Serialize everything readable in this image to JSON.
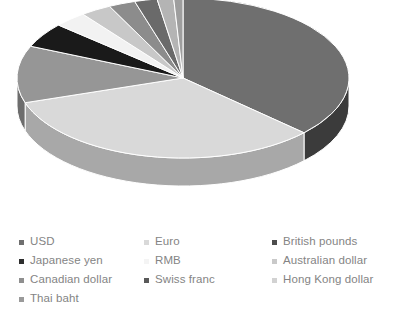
{
  "chart_data": {
    "type": "pie",
    "title": "",
    "subtitle": "",
    "xlabel": "",
    "ylabel": "",
    "three_d": true,
    "legend_position": "bottom",
    "grid": false,
    "categories": [
      "USD",
      "Euro",
      "British pounds",
      "Japanese yen",
      "RMB",
      "Australian dollar",
      "Canadian dollar",
      "Swiss franc",
      "Hong Kong dollar",
      "Thai baht"
    ],
    "values": [
      37.0,
      33.0,
      11.5,
      5.0,
      3.2,
      3.0,
      2.6,
      2.2,
      1.6,
      0.9
    ],
    "colors": [
      "#6f6f6f",
      "#d9d9d9",
      "#969696",
      "#1a1a1a",
      "#f2f2f2",
      "#c8c8c8",
      "#8c8c8c",
      "#6a6a6a",
      "#b4b4b4",
      "#9e9e9e"
    ],
    "side_colors": [
      "#3b3b3b",
      "#a8a8a8",
      "#6d6d6d",
      "#0d0d0d",
      "#c4c4c4",
      "#9a9a9a",
      "#676767",
      "#4e4e4e",
      "#8a8a8a",
      "#777777"
    ],
    "slice_borders": "#ffffff",
    "start_angle_deg": -90,
    "direction": "clockwise"
  },
  "legend": {
    "rows": [
      [
        {
          "label": "USD",
          "color": "#6f6f6f",
          "visible": true
        },
        {
          "label": "Euro",
          "color": "#d9d9d9",
          "visible": true
        },
        {
          "label": "British pounds",
          "color": "#4d4d4d",
          "visible": true
        }
      ],
      [
        {
          "label": "Japanese yen",
          "color": "#2e2e2e",
          "visible": true
        },
        {
          "label": "RMB",
          "color": "#f4f4f4",
          "visible": true
        },
        {
          "label": "Australian dollar",
          "color": "#c9c9c9",
          "visible": true
        }
      ],
      [
        {
          "label": "Canadian dollar",
          "color": "#8f8f8f",
          "visible": true
        },
        {
          "label": "Swiss franc",
          "color": "#595959",
          "visible": true
        },
        {
          "label": "Hong Kong dollar",
          "color": "#d2d2d2",
          "visible": true
        }
      ],
      [
        {
          "label": "Thai baht",
          "color": "#9a9a9a",
          "visible": true
        },
        {
          "label": "",
          "color": "#ffffff",
          "visible": false
        },
        {
          "label": "",
          "color": "#ffffff",
          "visible": false
        }
      ]
    ]
  },
  "geometry": {
    "cx": 183,
    "cy": 78,
    "rx": 166,
    "ry": 80,
    "depth": 28
  }
}
